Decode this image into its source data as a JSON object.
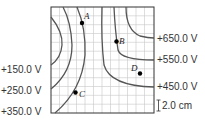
{
  "diagram": {
    "type": "equipotential-lines",
    "grid": {
      "columns": 12,
      "rows": 12,
      "scale_label": "2.0 cm"
    },
    "left_labels": [
      "+150.0 V",
      "+250.0 V",
      "+350.0 V"
    ],
    "right_labels": [
      "+650.0 V",
      "+550.0 V",
      "+450.0 V"
    ],
    "points": [
      {
        "name": "A"
      },
      {
        "name": "B"
      },
      {
        "name": "C"
      },
      {
        "name": "D"
      }
    ],
    "colors": {
      "grid": "#c8c8c8",
      "lines": "#555555",
      "frame": "#333333",
      "points": "#000000"
    }
  }
}
